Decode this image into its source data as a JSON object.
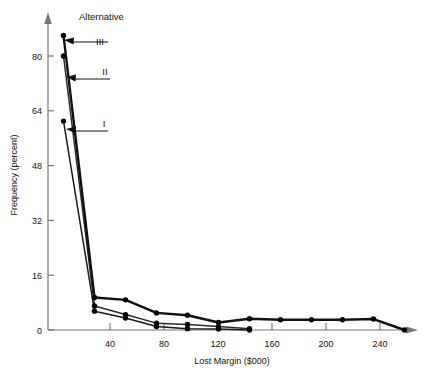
{
  "chart_data": {
    "type": "line",
    "title": "",
    "xlabel": "Lost Margin ($000)",
    "ylabel": "Frequency (percent)",
    "xlim": [
      0,
      260
    ],
    "ylim": [
      0,
      88
    ],
    "xticks": [
      40,
      80,
      120,
      160,
      200,
      240
    ],
    "yticks": [
      0,
      16,
      32,
      48,
      64,
      80
    ],
    "grid": false,
    "legend_position": "inline-annotations",
    "annotation_header": "Alternative",
    "series": [
      {
        "name": "I",
        "label": "I",
        "x": [
          10,
          30,
          50,
          70,
          90,
          110,
          130
        ],
        "y": [
          61,
          5.5,
          3.5,
          1.0,
          0.4,
          0.3,
          0.0
        ]
      },
      {
        "name": "II",
        "label": "II",
        "x": [
          10,
          30,
          50,
          70,
          90,
          110,
          130
        ],
        "y": [
          80,
          7.0,
          4.5,
          2.0,
          1.6,
          1.0,
          0.4
        ]
      },
      {
        "name": "III",
        "label": "III",
        "x": [
          10,
          30,
          50,
          70,
          90,
          110,
          130,
          150,
          170,
          190,
          210,
          230
        ],
        "y": [
          86,
          9.5,
          8.8,
          5.0,
          4.3,
          2.2,
          3.3,
          3.0,
          3.0,
          3.0,
          3.2,
          0.0
        ]
      }
    ],
    "colors": {
      "axis": "#777777",
      "series_I": "#1a1a1a",
      "series_II": "#2b2b2b",
      "series_III": "#111111",
      "marker": "#000000",
      "text": "#111111"
    }
  }
}
